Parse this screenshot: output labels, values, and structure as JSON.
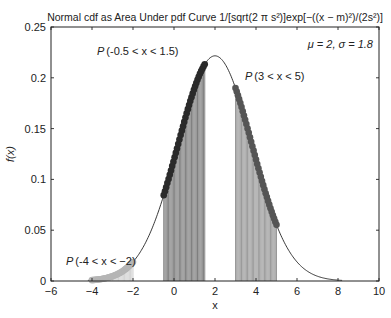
{
  "chart_data": {
    "type": "line",
    "title": "Normal cdf as Area Under pdf Curve 1/[sqrt(2 π s²)]exp[−((x − m)²)/(2s²)]",
    "xlabel": "x",
    "ylabel": "f(x)",
    "xlim": [
      -6,
      10
    ],
    "ylim": [
      0,
      0.25
    ],
    "xticks": [
      -6,
      -4,
      -2,
      0,
      2,
      4,
      6,
      8,
      10
    ],
    "yticks": [
      0,
      0.05,
      0.1,
      0.15,
      0.2,
      0.25
    ],
    "xtick_labels": [
      "−6",
      "−4",
      "−2",
      "0",
      "2",
      "4",
      "6",
      "8",
      "10"
    ],
    "ytick_labels": [
      "0",
      "0.05",
      "0.1",
      "0.15",
      "0.2",
      "0.25"
    ],
    "grid": false,
    "distribution": {
      "mu": 2,
      "sigma": 1.8
    },
    "series": [
      {
        "name": "pdf curve",
        "x_range": [
          -4.2,
          8.2
        ],
        "style": "thin black line"
      },
      {
        "name": "P(-4 < x < -2)",
        "x_range": [
          -4,
          -2
        ],
        "color": "#b5b5b5",
        "style": "light gray dots with stems"
      },
      {
        "name": "P(-0.5 < x < 1.5)",
        "x_range": [
          -0.5,
          1.5
        ],
        "color": "#2a2a2a",
        "style": "dark dots with stems"
      },
      {
        "name": "P(3 < x < 5)",
        "x_range": [
          3,
          5
        ],
        "color": "#555555",
        "style": "medium gray dots with stems"
      }
    ],
    "annotations": [
      {
        "text_prefix": "P",
        "text_body": " (-4 < x < −2)",
        "x": -4.6,
        "y": 0.024
      },
      {
        "text_prefix": "P",
        "text_body": " (-0.5 < x < 1.5)",
        "x": -2.9,
        "y": 0.216
      },
      {
        "text_prefix": "P",
        "text_body": " (3 < x < 5)",
        "x": 3.4,
        "y": 0.184
      },
      {
        "text": "μ = 2, σ = 1.8",
        "x": 6.8,
        "y": 0.233
      }
    ]
  },
  "labels": {
    "title": "Normal cdf as Area Under pdf Curve 1/[sqrt(2 π s²)]exp[−((x − m)²)/(2s²)]",
    "xlabel": "x",
    "ylabel": "f(x)",
    "params": "μ = 2, σ = 1.8",
    "ann_left": "(-4 < x < −2)",
    "ann_mid": "(-0.5 < x < 1.5)",
    "ann_right": "(3 < x < 5)",
    "ann_p": "P"
  }
}
